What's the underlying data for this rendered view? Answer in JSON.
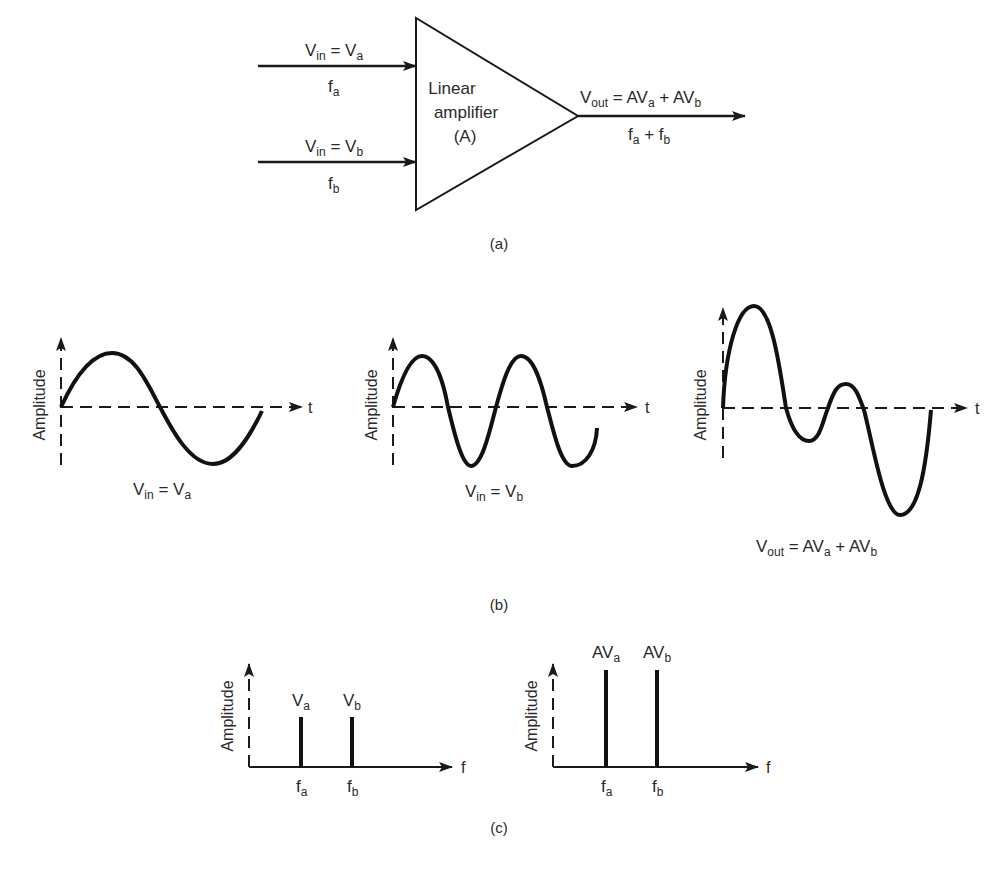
{
  "figure": {
    "panel_a": {
      "caption": "(a)",
      "amplifier": {
        "line1": "Linear",
        "line2": "amplifier",
        "line3": "(A)"
      },
      "input_a": {
        "v_main": "V",
        "v_sub": "in",
        "eq": " = V",
        "eq_sub": "a",
        "f_main": "f",
        "f_sub": "a"
      },
      "input_b": {
        "v_main": "V",
        "v_sub": "in",
        "eq": " = V",
        "eq_sub": "b",
        "f_main": "f",
        "f_sub": "b"
      },
      "output": {
        "v_main": "V",
        "v_sub": "out",
        "eq1": " = AV",
        "eq1_sub": "a",
        "eq2": " + AV",
        "eq2_sub": "b",
        "f1": "f",
        "f1_sub": "a",
        "plus": " + f",
        "f2_sub": "b"
      }
    },
    "panel_b": {
      "caption": "(b)",
      "axis_y_label": "Amplitude",
      "axis_x_label": "t",
      "plots": [
        {
          "name": "input-a",
          "label_main": "V",
          "label_sub": "in",
          "label_eq": " = V",
          "label_eq_sub": "a"
        },
        {
          "name": "input-b",
          "label_main": "V",
          "label_sub": "in",
          "label_eq": " = V",
          "label_eq_sub": "b"
        },
        {
          "name": "output",
          "label_main": "V",
          "label_sub": "out",
          "label_eq": " = AV",
          "label_eq_sub": "a",
          "label_eq2": " + AV",
          "label_eq2_sub": "b"
        }
      ]
    },
    "panel_c": {
      "caption": "(c)",
      "axis_y_label": "Amplitude",
      "axis_x_label": "f",
      "spectra": [
        {
          "name": "input-spectrum",
          "bars": [
            {
              "top_main": "V",
              "top_sub": "a",
              "bottom_main": "f",
              "bottom_sub": "a"
            },
            {
              "top_main": "V",
              "top_sub": "b",
              "bottom_main": "f",
              "bottom_sub": "b"
            }
          ]
        },
        {
          "name": "output-spectrum",
          "bars": [
            {
              "top_main": "AV",
              "top_sub": "a",
              "bottom_main": "f",
              "bottom_sub": "a"
            },
            {
              "top_main": "AV",
              "top_sub": "b",
              "bottom_main": "f",
              "bottom_sub": "b"
            }
          ]
        }
      ]
    }
  }
}
